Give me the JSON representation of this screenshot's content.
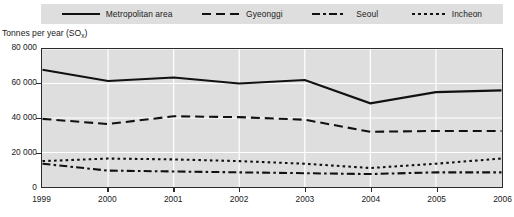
{
  "chart_data": {
    "type": "line",
    "title": "",
    "xlabel": "",
    "ylabel": "Tonnes per year (SOₓ)",
    "ylabel_main": "Tonnes per year (SO",
    "ylabel_sub": "x",
    "ylabel_close": ")",
    "categories": [
      "1999",
      "2000",
      "2001",
      "2002",
      "2003",
      "2004",
      "2005",
      "2006"
    ],
    "x": [
      1999,
      2000,
      2001,
      2002,
      2003,
      2004,
      2005,
      2006
    ],
    "ylim": [
      0,
      80000
    ],
    "yticks": [
      0,
      20000,
      40000,
      60000,
      80000
    ],
    "ytick_labels": [
      "0",
      "20 000",
      "40 000",
      "60 000",
      "80 000"
    ],
    "grid": true,
    "grid_color": "#ffffff",
    "plot_background": "#dedede",
    "line_color": "#111111",
    "legend_position": "top",
    "series": [
      {
        "name": "Metropolitan area",
        "style": "solid",
        "values": [
          68000,
          61500,
          63500,
          60000,
          62000,
          48500,
          55000,
          56000
        ]
      },
      {
        "name": "Gyeonggi",
        "style": "dashed",
        "values": [
          39500,
          36500,
          41000,
          40500,
          39000,
          32000,
          32500,
          32500
        ]
      },
      {
        "name": "Seoul",
        "style": "dashdot",
        "values": [
          13500,
          9500,
          9000,
          8500,
          8000,
          7500,
          8500,
          8500
        ]
      },
      {
        "name": "Incheon",
        "style": "dotted",
        "values": [
          15000,
          16500,
          16000,
          15000,
          13500,
          11000,
          13500,
          16500
        ]
      }
    ]
  },
  "legend": {
    "items": [
      {
        "label": "Metropolitan area",
        "style": "solid",
        "icon": "line-solid-icon"
      },
      {
        "label": "Gyeonggi",
        "style": "dashed",
        "icon": "line-dashed-icon"
      },
      {
        "label": "Seoul",
        "style": "dashdot",
        "icon": "line-dashdot-icon"
      },
      {
        "label": "Incheon",
        "style": "dotted",
        "icon": "line-dotted-icon"
      }
    ]
  }
}
